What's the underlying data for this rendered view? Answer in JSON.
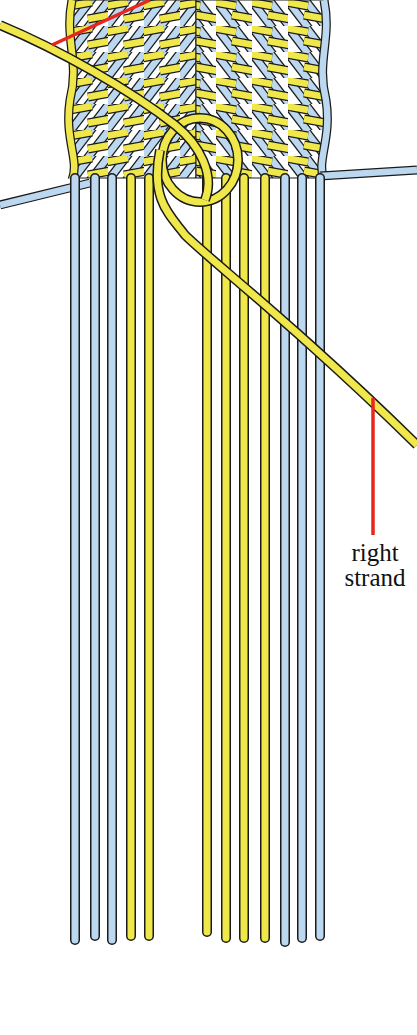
{
  "diagram": {
    "colors": {
      "blue_strand": "#bcd8f0",
      "yellow_strand": "#f0e84a",
      "outline": "#1a1a1a",
      "pointer": "#e8261e",
      "background": "#ffffff"
    },
    "hanging_strands_left": [
      {
        "x": 75,
        "color": "blue"
      },
      {
        "x": 95,
        "color": "blue"
      },
      {
        "x": 112,
        "color": "blue"
      },
      {
        "x": 131,
        "color": "yellow"
      },
      {
        "x": 149,
        "color": "yellow"
      }
    ],
    "hanging_strands_right": [
      {
        "x": 207,
        "color": "yellow"
      },
      {
        "x": 226,
        "color": "yellow"
      },
      {
        "x": 244,
        "color": "yellow"
      },
      {
        "x": 265,
        "color": "yellow"
      },
      {
        "x": 285,
        "color": "blue"
      },
      {
        "x": 302,
        "color": "blue"
      },
      {
        "x": 320,
        "color": "blue"
      }
    ]
  },
  "labels": {
    "right_strand_line1": "right",
    "right_strand_line2": "strand"
  }
}
